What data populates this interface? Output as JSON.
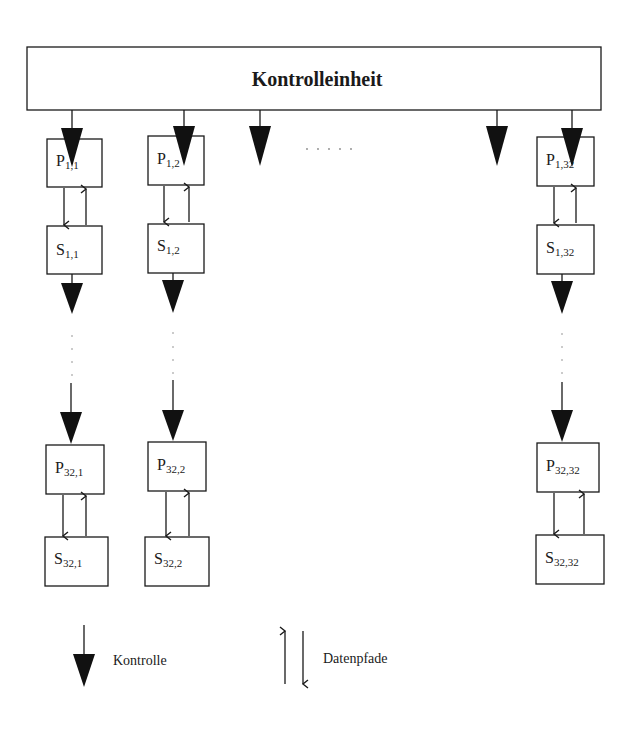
{
  "control_unit": {
    "label": "Kontrolleinheit"
  },
  "top_ellipsis": ". . . . .",
  "columns": [
    {
      "p_top": {
        "base": "P",
        "sub": "1,1"
      },
      "s_top": {
        "base": "S",
        "sub": "1,1"
      },
      "p_bot": {
        "base": "P",
        "sub": "32,1"
      },
      "s_bot": {
        "base": "S",
        "sub": "32,1"
      }
    },
    {
      "p_top": {
        "base": "P",
        "sub": "1,2"
      },
      "s_top": {
        "base": "S",
        "sub": "1,2"
      },
      "p_bot": {
        "base": "P",
        "sub": "32,2"
      },
      "s_bot": {
        "base": "S",
        "sub": "32,2"
      }
    },
    {
      "p_top": {
        "base": "P",
        "sub": "1,32"
      },
      "s_top": {
        "base": "S",
        "sub": "1,32"
      },
      "p_bot": {
        "base": "P",
        "sub": "32,32"
      },
      "s_bot": {
        "base": "S",
        "sub": "32,32"
      }
    }
  ],
  "legend": {
    "control": "Kontrolle",
    "datapaths": "Datenpfade"
  },
  "colors": {
    "stroke": "#1a1a1a",
    "fill": "#111111",
    "background": "#ffffff"
  }
}
